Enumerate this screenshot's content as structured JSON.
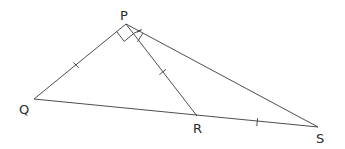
{
  "diagram": {
    "type": "geometry-triangle",
    "stroke_color": "#3a3a3a",
    "background": "#ffffff",
    "points": {
      "P": {
        "label": "P",
        "x": 126,
        "y": 24
      },
      "Q": {
        "label": "Q",
        "x": 34,
        "y": 99
      },
      "R": {
        "label": "R",
        "x": 197,
        "y": 116
      },
      "S": {
        "label": "S",
        "x": 318,
        "y": 127
      }
    },
    "segments": [
      "PQ",
      "PR",
      "PS",
      "QR",
      "RS"
    ],
    "equal_marks": [
      "PQ",
      "PR",
      "RS"
    ],
    "right_angle": "QPR",
    "angle_mark": "RPS",
    "labels": {
      "P": "P",
      "Q": "Q",
      "R": "R",
      "S": "S"
    }
  }
}
